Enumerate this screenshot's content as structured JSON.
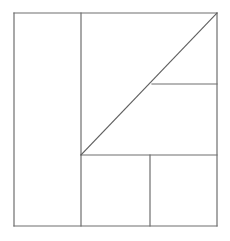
{
  "figure": {
    "kind": "geometric-line-diagram",
    "canvas": {
      "width": 230,
      "height": 241
    },
    "background_color": "#ffffff",
    "line_color": "#6e6e6e",
    "line_width": 1.2,
    "diagonal_color": "#5f5f5f",
    "diagonal_width": 1.1
  },
  "bounds": {
    "left": 14,
    "top": 13,
    "right": 217,
    "bottom": 226,
    "width": 203,
    "height": 213
  },
  "points": {
    "top_left": {
      "x": 14,
      "y": 13
    },
    "top_right": {
      "x": 217,
      "y": 13
    },
    "bottom_left": {
      "x": 14,
      "y": 226
    },
    "bottom_right": {
      "x": 217,
      "y": 226
    },
    "inner_corner": {
      "x": 81,
      "y": 155
    },
    "diagonal_mid_junction": {
      "x": 152,
      "y": 84
    },
    "divider_top": {
      "x": 81,
      "y": 13
    },
    "divider_bottom": {
      "x": 81,
      "y": 226
    },
    "lower_divider_top": {
      "x": 150,
      "y": 155
    },
    "lower_divider_bottom": {
      "x": 150,
      "y": 226
    }
  },
  "segments": [
    {
      "name": "outer-top-edge",
      "x1": 14,
      "y1": 13,
      "x2": 217,
      "y2": 13
    },
    {
      "name": "outer-right-edge",
      "x1": 217,
      "y1": 13,
      "x2": 217,
      "y2": 226
    },
    {
      "name": "outer-bottom-edge",
      "x1": 217,
      "y1": 226,
      "x2": 14,
      "y2": 226
    },
    {
      "name": "outer-left-edge",
      "x1": 14,
      "y1": 226,
      "x2": 14,
      "y2": 13
    },
    {
      "name": "tall-left-divider",
      "x1": 81,
      "y1": 13,
      "x2": 81,
      "y2": 226
    },
    {
      "name": "mid-horizontal-divider",
      "x1": 81,
      "y1": 155,
      "x2": 217,
      "y2": 155
    },
    {
      "name": "upper-right-horizontal",
      "x1": 152,
      "y1": 84,
      "x2": 217,
      "y2": 84
    },
    {
      "name": "lower-vertical-divider",
      "x1": 150,
      "y1": 155,
      "x2": 150,
      "y2": 226
    }
  ],
  "diagonal": {
    "name": "main-diagonal",
    "from": {
      "x": 81,
      "y": 155
    },
    "to": {
      "x": 217,
      "y": 13
    },
    "slope_description": "45-degree rising to the top-right corner"
  },
  "regions": [
    {
      "name": "left-tall-rectangle",
      "x": 14,
      "y": 13,
      "width": 67,
      "height": 213
    },
    {
      "name": "upper-middle-triangle-area",
      "x": 81,
      "y": 13,
      "width": 136,
      "height": 142
    },
    {
      "name": "right-small-rectangle",
      "x": 152,
      "y": 84,
      "width": 65,
      "height": 71
    },
    {
      "name": "bottom-left-square",
      "x": 81,
      "y": 155,
      "width": 69,
      "height": 71
    },
    {
      "name": "bottom-right-square",
      "x": 150,
      "y": 155,
      "width": 67,
      "height": 71
    }
  ]
}
